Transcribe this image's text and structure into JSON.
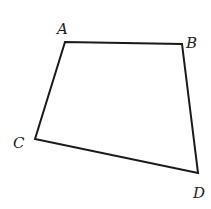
{
  "figure": {
    "type": "quadrilateral",
    "stroke_color": "#1a1a1a",
    "vertices": [
      {
        "label": "A",
        "x": 65,
        "y": 42
      },
      {
        "label": "B",
        "x": 182,
        "y": 44
      },
      {
        "label": "D",
        "x": 198,
        "y": 173
      },
      {
        "label": "C",
        "x": 35,
        "y": 139
      }
    ],
    "labels": {
      "A": "A",
      "B": "B",
      "C": "C",
      "D": "D"
    }
  }
}
